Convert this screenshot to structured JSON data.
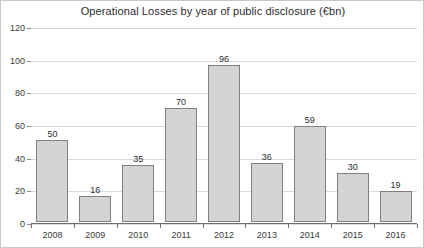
{
  "chart_data": {
    "type": "bar",
    "title": "Operational Losses by year of public disclosure (€bn)",
    "xlabel": "",
    "ylabel": "",
    "categories": [
      "2008",
      "2009",
      "2010",
      "2011",
      "2012",
      "2013",
      "2014",
      "2015",
      "2016"
    ],
    "values": [
      50,
      16,
      35,
      70,
      96,
      36,
      59,
      30,
      19
    ],
    "data_labels": [
      "50",
      "16",
      "35",
      "70",
      "96",
      "36",
      "59",
      "30",
      "19"
    ],
    "ylim": [
      0,
      120
    ],
    "yticks": [
      0,
      20,
      40,
      60,
      80,
      100,
      120
    ],
    "ytick_labels": [
      "0",
      "20",
      "40",
      "60",
      "80",
      "100",
      "120"
    ],
    "grid": true,
    "grid_axis": "y",
    "legend": false,
    "legend_position": "none",
    "series": [
      {
        "name": "Operational Losses",
        "values": [
          50,
          16,
          35,
          70,
          96,
          36,
          59,
          30,
          19
        ]
      }
    ],
    "colors": {
      "bar_fill": "#d4d4d4",
      "bar_border": "#808080",
      "gridline": "#d8dadd",
      "axis": "#6e6e6e",
      "text": "#2b2b2b",
      "background": "#ffffff",
      "frame": "#c8c8c8"
    }
  }
}
